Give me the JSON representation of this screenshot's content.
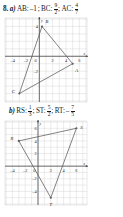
{
  "problem": {
    "number": "8.",
    "part_a_label": "a)",
    "part_b_label": "b)"
  },
  "answers_a": {
    "items": [
      {
        "name": "AB:",
        "value": "–1",
        "type": "plain"
      },
      {
        "name": "BC:",
        "numerator": "9",
        "denominator": "2",
        "type": "fraction"
      },
      {
        "name": "AC:",
        "numerator": "4",
        "denominator": "7",
        "type": "fraction"
      }
    ],
    "separator": ";"
  },
  "answers_b": {
    "items": [
      {
        "name": "RS:",
        "numerator": "1",
        "denominator": "3",
        "type": "fraction",
        "sign": ""
      },
      {
        "name": "ST:",
        "numerator": "5",
        "denominator": "2",
        "type": "fraction",
        "sign": ""
      },
      {
        "name": "RT:",
        "numerator": "7",
        "denominator": "5",
        "type": "fraction",
        "sign": "–"
      }
    ],
    "separator": ";"
  },
  "chart_data": [
    {
      "type": "scatter",
      "title": "Triangle ABC",
      "xlabel": "x",
      "ylabel": "y",
      "xlim": [
        -5,
        7
      ],
      "ylim": [
        -6,
        5
      ],
      "xticks": [
        "-4",
        "-2",
        "0",
        "2",
        "4",
        "6"
      ],
      "xtick_values": [
        -4,
        -2,
        0,
        2,
        4,
        6
      ],
      "yticks": [
        "4",
        "-2"
      ],
      "ytick_values": [
        4,
        -2
      ],
      "grid": true,
      "grid_color": "#c8c8c8",
      "axis_color": "#4a4a4a",
      "line_color": "#5a5a5a",
      "points": [
        {
          "label": "A",
          "x": 5,
          "y": -1,
          "label_dx": 4,
          "label_dy": 8
        },
        {
          "label": "B",
          "x": 0.4,
          "y": 4,
          "label_dx": 5,
          "label_dy": -3
        },
        {
          "label": "C",
          "x": -3,
          "y": -5,
          "label_dx": -6,
          "label_dy": -1
        }
      ],
      "edges": [
        [
          "A",
          "B"
        ],
        [
          "B",
          "C"
        ],
        [
          "C",
          "A"
        ]
      ]
    },
    {
      "type": "scatter",
      "title": "Triangle RST",
      "xlabel": "x",
      "ylabel": "y",
      "xlim": [
        -5,
        7.5
      ],
      "ylim": [
        -6,
        7
      ],
      "xticks": [
        "-4",
        "-2",
        "0",
        "2",
        "4",
        "6"
      ],
      "xtick_values": [
        -4,
        -2,
        0,
        2,
        4,
        6
      ],
      "yticks": [
        "6",
        "4",
        "2",
        "-2",
        "-4"
      ],
      "ytick_values": [
        6,
        4,
        2,
        -2,
        -4
      ],
      "grid": true,
      "grid_color": "#c8c8c8",
      "axis_color": "#4a4a4a",
      "line_color": "#5a5a5a",
      "points": [
        {
          "label": "R",
          "x": -3,
          "y": 4,
          "label_dx": -7,
          "label_dy": -1
        },
        {
          "label": "S",
          "x": 6,
          "y": 6,
          "label_dx": 5,
          "label_dy": 1
        },
        {
          "label": "T",
          "x": 2,
          "y": -5,
          "label_dx": 0,
          "label_dy": 8
        }
      ],
      "edges": [
        [
          "R",
          "S"
        ],
        [
          "S",
          "T"
        ],
        [
          "T",
          "R"
        ]
      ]
    }
  ]
}
